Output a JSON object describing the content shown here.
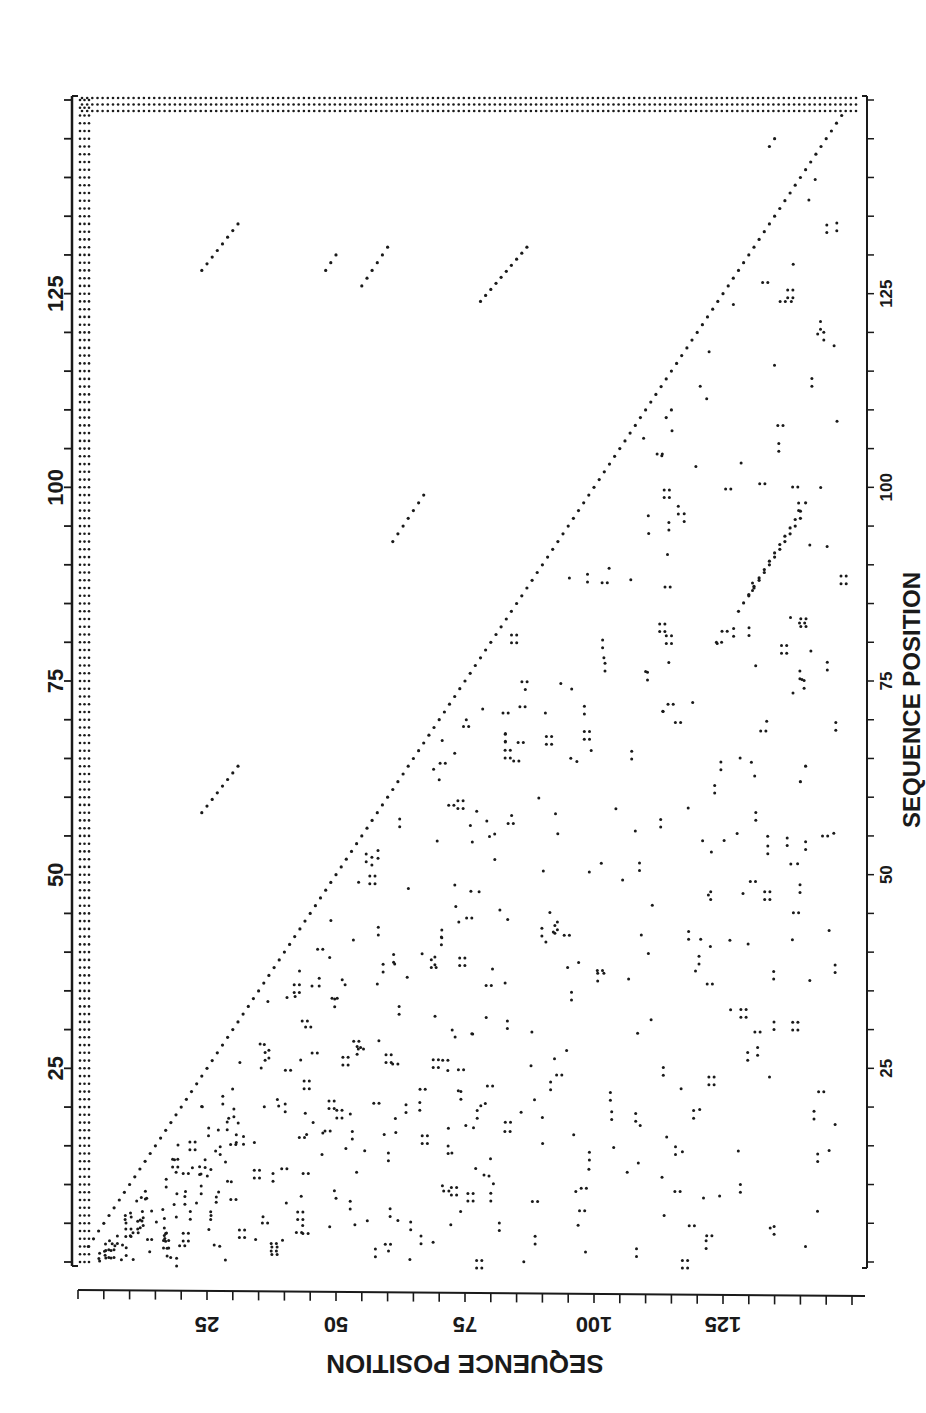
{
  "chart_data": {
    "type": "scatter",
    "subtype": "dot-matrix self-similarity plot",
    "title": "",
    "orientation": "rotated 90 degrees clockwise",
    "xlabel": "SEQUENCE POSITION",
    "ylabel": "SEQUENCE POSITION",
    "x_axis": {
      "range": [
        0,
        150
      ],
      "ticks": [
        25,
        50,
        75,
        100,
        125
      ],
      "tick_labels": [
        "25",
        "50",
        "75",
        "100",
        "125"
      ],
      "minor_tick_interval": 5
    },
    "y_axis": {
      "range": [
        0,
        150
      ],
      "ticks": [
        25,
        50,
        75,
        100,
        125
      ],
      "tick_labels": [
        "25",
        "50",
        "75",
        "100",
        "125"
      ],
      "minor_tick_interval": 5
    },
    "grid": false,
    "legend": null,
    "main_diagonal": {
      "from": [
        0,
        0
      ],
      "to": [
        150,
        150
      ],
      "description": "identity diagonal, dotted"
    },
    "edge_stripes": {
      "left_band_width_positions": 3,
      "top_band_height_positions": 3,
      "description": "3-dot-wide dense band along low end of both sequences"
    },
    "upper_triangle_segments": [
      {
        "x": [
          84,
          98
        ],
        "y": [
          128,
          141
        ],
        "label": "repeat A"
      },
      {
        "x": [
          86,
          96
        ],
        "y": [
          130,
          140
        ]
      },
      {
        "x": [
          93,
          99
        ],
        "y": [
          61,
          67
        ]
      },
      {
        "x": [
          124,
          131
        ],
        "y": [
          78,
          87
        ]
      },
      {
        "x": [
          126,
          131
        ],
        "y": [
          55,
          60
        ]
      },
      {
        "x": [
          128,
          134
        ],
        "y": [
          24,
          31
        ]
      },
      {
        "x": [
          58,
          64
        ],
        "y": [
          24,
          31
        ]
      },
      {
        "x": [
          62,
          64
        ],
        "y": [
          140,
          141
        ]
      },
      {
        "x": [
          109,
          110
        ],
        "y": [
          114,
          115
        ]
      },
      {
        "x": [
          144,
          145
        ],
        "y": [
          134,
          135
        ]
      },
      {
        "x": [
          128,
          130
        ],
        "y": [
          48,
          50
        ]
      }
    ],
    "lower_triangle": "dense scattered short matches (isolated dots, doublets and triplets) filling region below diagonal"
  },
  "axes": {
    "left": {
      "label": "SEQUENCE POSITION",
      "ticks": [
        "25",
        "50",
        "75",
        "100",
        "125"
      ]
    },
    "bottom": {
      "label": "SEQUENCE POSITION",
      "ticks": [
        "25",
        "50",
        "75",
        "100",
        "125"
      ]
    },
    "right": {
      "ticks": [
        "25",
        "50",
        "75",
        "100",
        "125"
      ]
    },
    "top": {
      "ticks": [
        "25",
        "50",
        "75",
        "100",
        "125"
      ]
    }
  },
  "colors": {
    "ink": "#1a1a1a",
    "background": "#ffffff"
  }
}
